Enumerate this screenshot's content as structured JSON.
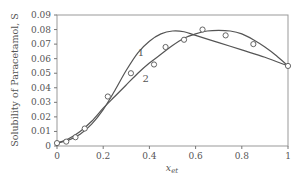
{
  "chart_data": {
    "type": "scatter",
    "title": "",
    "xlabel": "x",
    "xlabel_subscript": "et",
    "ylabel": "Solubility of Paracetamol, S",
    "xlim": [
      0,
      1
    ],
    "ylim": [
      0,
      0.09
    ],
    "xticks": [
      0,
      0.2,
      0.4,
      0.6,
      0.8,
      1
    ],
    "xtick_labels": [
      "0",
      "0.2",
      "0.4",
      "0.6",
      "0.8",
      "1"
    ],
    "yticks": [
      0,
      0.01,
      0.02,
      0.03,
      0.04,
      0.05,
      0.06,
      0.07,
      0.08,
      0.09
    ],
    "ytick_labels": [
      "0",
      "0.01",
      "0.02",
      "0.03",
      "0.04",
      "0.05",
      "0.06",
      "0.07",
      "0.08",
      "0.09"
    ],
    "grid": false,
    "legend": "none",
    "points": {
      "name": "Experimental",
      "x": [
        0.0,
        0.04,
        0.08,
        0.12,
        0.22,
        0.32,
        0.42,
        0.47,
        0.55,
        0.63,
        0.73,
        0.85,
        1.0
      ],
      "y": [
        0.002,
        0.003,
        0.006,
        0.012,
        0.034,
        0.05,
        0.056,
        0.068,
        0.073,
        0.08,
        0.076,
        0.07,
        0.055
      ]
    },
    "series": [
      {
        "name": "1",
        "label_at": [
          0.35,
          0.062
        ],
        "x": [
          0.0,
          0.05,
          0.1,
          0.15,
          0.2,
          0.25,
          0.3,
          0.35,
          0.4,
          0.45,
          0.5,
          0.55,
          0.6,
          0.7,
          0.8,
          0.9,
          1.0
        ],
        "y": [
          0.002,
          0.004,
          0.008,
          0.015,
          0.025,
          0.038,
          0.052,
          0.064,
          0.072,
          0.077,
          0.079,
          0.0785,
          0.076,
          0.071,
          0.066,
          0.061,
          0.055
        ]
      },
      {
        "name": "2",
        "label_at": [
          0.37,
          0.044
        ],
        "x": [
          0.0,
          0.05,
          0.1,
          0.15,
          0.2,
          0.25,
          0.3,
          0.35,
          0.4,
          0.45,
          0.5,
          0.55,
          0.6,
          0.65,
          0.7,
          0.75,
          0.8,
          0.85,
          0.9,
          0.95,
          1.0
        ],
        "y": [
          0.002,
          0.005,
          0.01,
          0.017,
          0.026,
          0.034,
          0.042,
          0.05,
          0.057,
          0.063,
          0.069,
          0.074,
          0.077,
          0.079,
          0.0795,
          0.079,
          0.077,
          0.073,
          0.068,
          0.062,
          0.055
        ]
      }
    ]
  }
}
